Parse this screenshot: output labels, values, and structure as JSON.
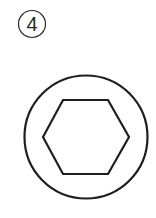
{
  "figure": {
    "label": {
      "number": "4",
      "style": "circled"
    },
    "drawing": {
      "description": "Top view of a hex socket head: outer circle with inscribed regular hexagon",
      "outer_shape": "circle",
      "inner_shape": "hexagon"
    },
    "colors": {
      "stroke": "#1e1e1e",
      "background": "#ffffff"
    }
  }
}
